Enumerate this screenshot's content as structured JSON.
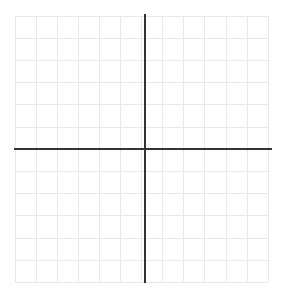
{
  "figure": {
    "title": "",
    "background_color": "#ffffff",
    "width": 283,
    "height": 294
  },
  "chart_data": {
    "type": "scatter",
    "title": "",
    "subtitle": "",
    "xlabel": "",
    "ylabel": "",
    "series": [],
    "x": [],
    "values": [],
    "annotations": [],
    "legend": {
      "visible": false,
      "position": "none",
      "entries": []
    },
    "grid": {
      "visible": true,
      "color": "#e8e8e8",
      "line_width": 1,
      "columns": 12,
      "rows": 12,
      "cell_width": 21.1,
      "cell_height": 22.2,
      "left": 15,
      "top": 16,
      "right": 268,
      "bottom": 282,
      "x_lines": [
        15,
        36.1,
        57.2,
        78.3,
        99.4,
        120.5,
        141.6,
        162.7,
        183.8,
        204.9,
        226.0,
        247.1,
        268.2
      ],
      "y_lines": [
        16,
        38.2,
        60.4,
        82.6,
        104.8,
        127.0,
        149.2,
        171.4,
        193.6,
        215.8,
        238.0,
        260.2,
        282.4
      ]
    },
    "axes": {
      "color": "#333333",
      "line_width": 2,
      "x_axis": {
        "label": "",
        "orientation": "horizontal",
        "position_y": 149,
        "start_x": 14,
        "end_x": 272,
        "ticks": [],
        "tick_labels": [],
        "range": [
          -6,
          6
        ]
      },
      "y_axis": {
        "label": "",
        "orientation": "vertical",
        "position_x": 145,
        "start_y": 14,
        "end_y": 283,
        "ticks": [],
        "tick_labels": [],
        "range": [
          -6,
          6
        ]
      },
      "origin": {
        "x": 145,
        "y": 149,
        "label": ""
      }
    },
    "xlim": [
      -6,
      6
    ],
    "ylim": [
      -6,
      6
    ]
  }
}
